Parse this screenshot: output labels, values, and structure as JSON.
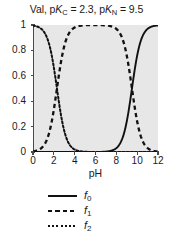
{
  "chart_data": {
    "type": "line",
    "title": "Val, pKC = 2.3, pKN = 9.5",
    "title_parts": {
      "name": "Val,",
      "pk1_prefix": "p",
      "pk1_k": "K",
      "pk1_sub": "C",
      "pk1_eq": "= 2.3,",
      "pk2_prefix": "p",
      "pk2_k": "K",
      "pk2_sub": "N",
      "pk2_eq": "= 9.5"
    },
    "xlabel": "pH",
    "ylabel": "",
    "xlim": [
      0,
      12
    ],
    "ylim": [
      0,
      1
    ],
    "xticks": [
      0,
      2,
      4,
      6,
      8,
      10,
      12
    ],
    "xticklabels": [
      "0",
      "2",
      "4",
      "6",
      "8",
      "10",
      "12"
    ],
    "yticks": [
      0,
      0.2,
      0.4,
      0.6,
      0.8,
      1
    ],
    "yticklabels": [
      "0",
      "0.2",
      "0.4",
      "0.6",
      "0.8",
      "1"
    ],
    "grid": false,
    "legend_position": "below",
    "plot_bgcolor": "#e7e7e7",
    "line_color": "#111111",
    "pKa": [
      2.3,
      9.5
    ],
    "series": [
      {
        "name": "f0",
        "label_base": "f",
        "label_sub": "0",
        "linestyle": "solid",
        "description": "fully deprotonated fraction; sigmoidal rise centred at pH 9.5",
        "x": [
          0,
          1,
          2,
          2.3,
          3,
          4,
          5,
          6,
          7,
          7.5,
          8,
          8.5,
          9,
          9.5,
          10,
          10.5,
          11,
          11.5,
          12
        ],
        "y": [
          0.0,
          0.0,
          0.0,
          0.0,
          0.0,
          0.0,
          0.0,
          0.0,
          0.003,
          0.01,
          0.031,
          0.091,
          0.24,
          0.5,
          0.76,
          0.909,
          0.969,
          0.99,
          0.997
        ]
      },
      {
        "name": "f1",
        "label_base": "f",
        "label_sub": "1",
        "linestyle": "dashed",
        "description": "zwitterion fraction; rises across pKC = 2.3 and falls across pKN = 9.5",
        "x": [
          0,
          0.5,
          1,
          1.5,
          2,
          2.3,
          3,
          3.5,
          4,
          5,
          6,
          7,
          8,
          9,
          9.5,
          10,
          10.5,
          11,
          11.5,
          12
        ],
        "y": [
          0.005,
          0.015,
          0.048,
          0.137,
          0.333,
          0.5,
          0.833,
          0.94,
          0.98,
          0.998,
          1.0,
          0.997,
          0.969,
          0.76,
          0.5,
          0.24,
          0.091,
          0.031,
          0.01,
          0.003
        ]
      },
      {
        "name": "f2",
        "label_base": "f",
        "label_sub": "2",
        "linestyle": "dotted",
        "description": "fully protonated fraction; sigmoidal fall centred at pH 2.3",
        "x": [
          0,
          0.5,
          1,
          1.5,
          2,
          2.3,
          2.6,
          3,
          3.5,
          4,
          4.5,
          5,
          6,
          7,
          8,
          10,
          12
        ],
        "y": [
          0.995,
          0.985,
          0.952,
          0.863,
          0.667,
          0.5,
          0.333,
          0.167,
          0.06,
          0.02,
          0.006,
          0.002,
          0.0,
          0.0,
          0.0,
          0.0,
          0.0
        ]
      }
    ]
  }
}
